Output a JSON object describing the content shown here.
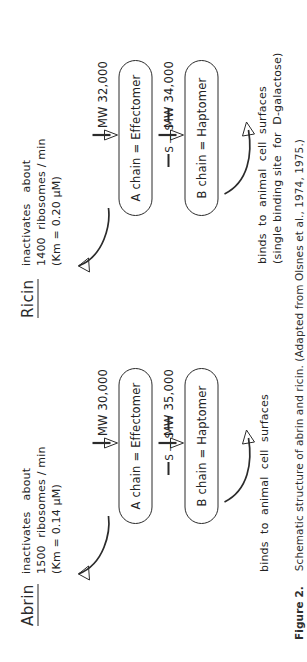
{
  "figure": {
    "caption_label": "Figure 2.",
    "caption_text": "Schematic structure of abrin and ricin. (Adapted from Olsnes et al., 1974, 1975.)"
  },
  "groups": [
    {
      "id": "abrin",
      "title": "Abrin",
      "activity_note_line1": "inactivates   about",
      "activity_note_line2": "1500  ribosomes / min",
      "activity_note_line3": "(Km = 0.14 µM)",
      "a_chain": {
        "label": "A chain = Effectomer",
        "mw": "MW 30,000"
      },
      "b_chain": {
        "label": "B chain = Haptomer",
        "mw": "MW 35,000"
      },
      "binding_note_line1": "binds  to  animal  cell  surfaces",
      "binding_note_line2": "",
      "disulfide": {
        "left": "S",
        "dash": "—",
        "right": "S"
      }
    },
    {
      "id": "ricin",
      "title": "Ricin",
      "activity_note_line1": "inactivates   about",
      "activity_note_line2": "1400  ribosomes / min",
      "activity_note_line3": "(Km = 0.20 µM)",
      "a_chain": {
        "label": "A chain = Effectomer",
        "mw": "MW 32,000"
      },
      "b_chain": {
        "label": "B chain = Haptomer",
        "mw": "MW 34,000"
      },
      "binding_note_line1": "binds  to  animal  cell  surfaces",
      "binding_note_line2": "(single binding site  for  D-galactose)",
      "disulfide": {
        "left": "S",
        "dash": "—",
        "right": "S"
      }
    }
  ],
  "colors": {
    "ink": "#2b2b2b",
    "paper": "#ffffff"
  }
}
